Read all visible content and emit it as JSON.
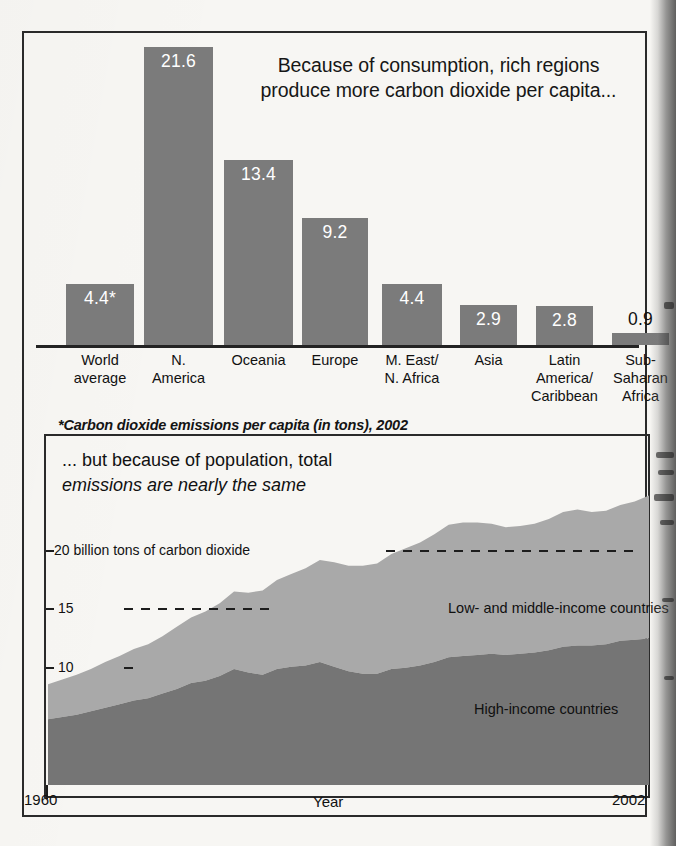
{
  "figure": {
    "bar_chart": {
      "title": "Because of consumption, rich regions produce more carbon dioxide per capita...",
      "title_line1": "Because of consumption, rich regions",
      "title_line2": "produce more carbon dioxide per capita...",
      "footnote": "*Carbon dioxide emissions per capita (in tons), 2002",
      "bar_color": "#7b7b7b",
      "value_label_color": "#ffffff"
    },
    "area_chart": {
      "title_line1": "... but because of population, total",
      "title_line2": "emissions are nearly the same",
      "y_ticks": [
        {
          "value": 20,
          "label": "20 billion tons of carbon dioxide"
        },
        {
          "value": 15,
          "label": "15"
        },
        {
          "value": 10,
          "label": "10"
        }
      ],
      "x_axis_label": "Year",
      "x_start_label": "1960",
      "x_end_label": "2002",
      "series_labels": {
        "low_mid": "Low- and middle-income countries",
        "high": "High-income countries"
      },
      "colors": {
        "low_mid": "#a9a9a9",
        "high": "#757575"
      }
    }
  },
  "chart_data": [
    {
      "type": "bar",
      "title": "Because of consumption, rich regions produce more carbon dioxide per capita...",
      "xlabel": "",
      "ylabel": "Carbon dioxide emissions per capita (in tons), 2002",
      "ylim": [
        0,
        22
      ],
      "grid": false,
      "legend": "none",
      "categories": [
        "World average",
        "N. America",
        "Oceania",
        "Europe",
        "M. East/ N. Africa",
        "Asia",
        "Latin America/ Caribbean",
        "Sub- Saharan Africa"
      ],
      "category_lines": [
        [
          "World",
          "average"
        ],
        [
          "N.",
          "America"
        ],
        [
          "Oceania"
        ],
        [
          "Europe"
        ],
        [
          "M. East/",
          "N. Africa"
        ],
        [
          "Asia"
        ],
        [
          "Latin",
          "America/",
          "Caribbean"
        ],
        [
          "Sub-",
          "Saharan",
          "Africa"
        ]
      ],
      "values": [
        4.4,
        21.6,
        13.4,
        9.2,
        4.4,
        2.9,
        2.8,
        0.9
      ],
      "value_labels": [
        "4.4*",
        "21.6",
        "13.4",
        "9.2",
        "4.4",
        "2.9",
        "2.8",
        "0.9"
      ],
      "annotations": [
        "*Carbon dioxide emissions per capita (in tons), 2002"
      ]
    },
    {
      "type": "area",
      "stacked": true,
      "title": "... but because of population, total emissions are nearly the same",
      "xlabel": "Year",
      "ylabel": "billion tons of carbon dioxide",
      "xlim": [
        1960,
        2002
      ],
      "ylim": [
        0,
        25
      ],
      "yticks": [
        10,
        15,
        20
      ],
      "grid": false,
      "legend": "inline-labels",
      "x": [
        1960,
        1961,
        1962,
        1963,
        1964,
        1965,
        1966,
        1967,
        1968,
        1969,
        1970,
        1971,
        1972,
        1973,
        1974,
        1975,
        1976,
        1977,
        1978,
        1979,
        1980,
        1981,
        1982,
        1983,
        1984,
        1985,
        1986,
        1987,
        1988,
        1989,
        1990,
        1991,
        1992,
        1993,
        1994,
        1995,
        1996,
        1997,
        1998,
        1999,
        2000,
        2001,
        2002
      ],
      "series": [
        {
          "name": "High-income countries",
          "values": [
            5.6,
            5.8,
            6.0,
            6.3,
            6.6,
            6.9,
            7.2,
            7.4,
            7.8,
            8.2,
            8.7,
            8.9,
            9.3,
            9.9,
            9.6,
            9.4,
            9.9,
            10.1,
            10.2,
            10.5,
            10.1,
            9.7,
            9.5,
            9.5,
            9.9,
            10.0,
            10.2,
            10.5,
            10.9,
            11.0,
            11.1,
            11.2,
            11.1,
            11.2,
            11.3,
            11.5,
            11.8,
            11.9,
            11.9,
            12.0,
            12.3,
            12.4,
            12.5
          ]
        },
        {
          "name": "Low- and middle-income countries",
          "values": [
            3.0,
            3.2,
            3.4,
            3.6,
            3.9,
            4.1,
            4.4,
            4.6,
            4.9,
            5.3,
            5.6,
            5.9,
            6.2,
            6.6,
            6.8,
            7.2,
            7.6,
            7.9,
            8.3,
            8.7,
            8.9,
            9.0,
            9.2,
            9.4,
            9.8,
            10.2,
            10.5,
            10.9,
            11.3,
            11.4,
            11.3,
            11.1,
            10.9,
            10.9,
            11.0,
            11.2,
            11.5,
            11.6,
            11.4,
            11.4,
            11.6,
            11.8,
            12.2
          ]
        }
      ],
      "totals": [
        8.6,
        9.0,
        9.4,
        9.9,
        10.5,
        11.0,
        11.6,
        12.0,
        12.7,
        13.5,
        14.3,
        14.8,
        15.5,
        16.5,
        16.4,
        16.6,
        17.5,
        18.0,
        18.5,
        19.2,
        19.0,
        18.7,
        18.7,
        18.9,
        19.7,
        20.2,
        20.7,
        21.4,
        22.2,
        22.4,
        22.4,
        22.3,
        22.0,
        22.1,
        22.3,
        22.7,
        23.3,
        23.5,
        23.3,
        23.4,
        23.9,
        24.2,
        24.7
      ]
    }
  ]
}
